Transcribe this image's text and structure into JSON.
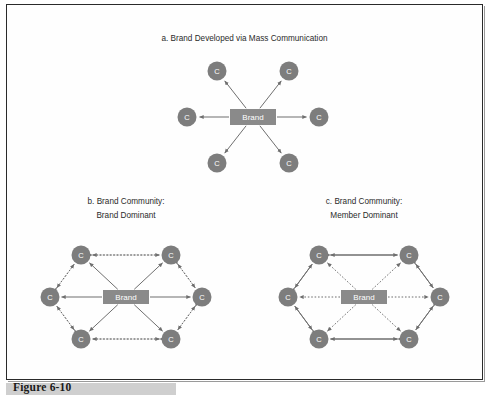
{
  "figure": {
    "caption": "Figure 6-10",
    "frame": {
      "border_color": "#2a2a2a",
      "background": "#fefefe"
    }
  },
  "colors": {
    "node_fill": "#7d7d7d",
    "brand_fill": "#8a8a8a",
    "edge": "#6f6f6f",
    "node_text": "#ffffff",
    "title_text": "#2b2b2b",
    "caption_bar": "#cfcfcf"
  },
  "labels": {
    "member": "C",
    "brand": "Brand"
  },
  "chart_data": {
    "type": "diagram",
    "panels": [
      {
        "id": "a",
        "title_lines": [
          "a. Brand Developed via Mass Communication"
        ],
        "layout": "star",
        "center": {
          "label": "Brand",
          "shape": "rect"
        },
        "members": [
          {
            "label": "C",
            "position": "upper-left"
          },
          {
            "label": "C",
            "position": "upper-right"
          },
          {
            "label": "C",
            "position": "left"
          },
          {
            "label": "C",
            "position": "right"
          },
          {
            "label": "C",
            "position": "lower-left"
          },
          {
            "label": "C",
            "position": "lower-right"
          }
        ],
        "edges": {
          "brand_to_member": {
            "style": "solid",
            "direction": "one-way",
            "count": 6
          },
          "member_to_member": {
            "style": "none",
            "direction": "none",
            "count": 0
          }
        }
      },
      {
        "id": "b",
        "title_lines": [
          "b. Brand Community:",
          "Brand Dominant"
        ],
        "layout": "hexagon",
        "center": {
          "label": "Brand",
          "shape": "rect"
        },
        "members": [
          {
            "label": "C",
            "position": "top-left"
          },
          {
            "label": "C",
            "position": "top-right"
          },
          {
            "label": "C",
            "position": "left"
          },
          {
            "label": "C",
            "position": "right"
          },
          {
            "label": "C",
            "position": "bottom-left"
          },
          {
            "label": "C",
            "position": "bottom-right"
          }
        ],
        "edges": {
          "brand_to_member": {
            "style": "solid",
            "direction": "one-way",
            "count": 6
          },
          "member_to_member": {
            "style": "dotted",
            "direction": "two-way",
            "count": 6
          }
        }
      },
      {
        "id": "c",
        "title_lines": [
          "c. Brand Community:",
          "Member Dominant"
        ],
        "layout": "hexagon",
        "center": {
          "label": "Brand",
          "shape": "rect"
        },
        "members": [
          {
            "label": "C",
            "position": "top-left"
          },
          {
            "label": "C",
            "position": "top-right"
          },
          {
            "label": "C",
            "position": "left"
          },
          {
            "label": "C",
            "position": "right"
          },
          {
            "label": "C",
            "position": "bottom-left"
          },
          {
            "label": "C",
            "position": "bottom-right"
          }
        ],
        "edges": {
          "brand_to_member": {
            "style": "dotted",
            "direction": "one-way",
            "count": 6
          },
          "member_to_member": {
            "style": "solid",
            "direction": "two-way",
            "count": 6
          }
        }
      }
    ]
  }
}
